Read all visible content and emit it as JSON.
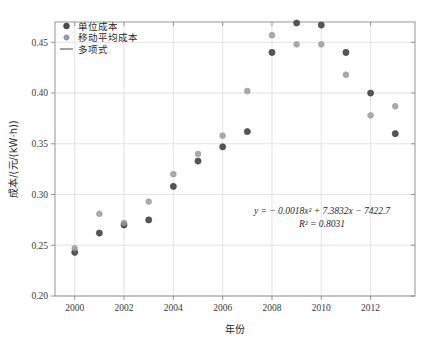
{
  "chart_data": {
    "type": "scatter",
    "title": "",
    "xlabel": "年份",
    "ylabel": "成本/(元/(kW·h))",
    "xlim": [
      1999.2,
      2013.8
    ],
    "ylim": [
      0.2,
      0.47
    ],
    "grid": true,
    "legend_position": "top-left",
    "x_ticks": [
      "2000",
      "2002",
      "2004",
      "2006",
      "2008",
      "2010",
      "2012"
    ],
    "x_tick_values": [
      2000,
      2002,
      2004,
      2006,
      2008,
      2010,
      2012
    ],
    "y_ticks": [
      "0.20",
      "0.25",
      "0.30",
      "0.35",
      "0.40",
      "0.45"
    ],
    "y_tick_values": [
      0.2,
      0.25,
      0.3,
      0.35,
      0.4,
      0.45
    ],
    "series": [
      {
        "name": "单位成本",
        "marker": "circle-filled",
        "color": "#4c4c52",
        "x": [
          2000,
          2001,
          2002,
          2003,
          2004,
          2005,
          2006,
          2007,
          2008,
          2009,
          2010,
          2011,
          2012,
          2013
        ],
        "values": [
          0.243,
          0.262,
          0.27,
          0.275,
          0.308,
          0.333,
          0.347,
          0.362,
          0.44,
          0.469,
          0.467,
          0.44,
          0.4,
          0.36
        ]
      },
      {
        "name": "移动平均成本",
        "marker": "circle-light",
        "color": "#9a9aa0",
        "x": [
          2000,
          2001,
          2002,
          2003,
          2004,
          2005,
          2006,
          2007,
          2008,
          2009,
          2010,
          2011,
          2012,
          2013
        ],
        "values": [
          0.247,
          0.281,
          0.272,
          0.293,
          0.32,
          0.34,
          0.358,
          0.402,
          0.457,
          0.448,
          0.448,
          0.418,
          0.378,
          0.387
        ]
      }
    ],
    "trendline": {
      "name": "多项式",
      "color": "#58585c",
      "equation": "y = − 0.0018x² + 7.3832x − 7422.7",
      "r2_label": "R² = 0.8031",
      "coefficients": {
        "a": -0.0018,
        "b": 7.3832,
        "c": -7422.7
      },
      "r_squared": 0.8031,
      "x_start": 2000,
      "x_end": 2013.4
    },
    "annotation": {
      "line1": "y = − 0.0018x² + 7.3832x − 7422.7",
      "line2": "R² = 0.8031"
    },
    "legend_entries": [
      {
        "label": "单位成本",
        "symbol": "dot-dark"
      },
      {
        "label": "移动平均成本",
        "symbol": "dot-light"
      },
      {
        "label": "多项式",
        "symbol": "line"
      }
    ]
  }
}
